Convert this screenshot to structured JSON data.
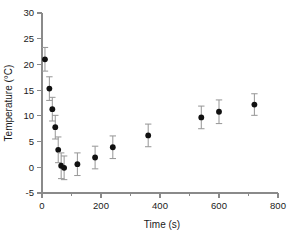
{
  "chart_data": {
    "type": "scatter",
    "title": "",
    "xlabel": "Time (s)",
    "ylabel": "Temperature (°C)",
    "xlim": [
      0,
      800
    ],
    "ylim": [
      -5,
      30
    ],
    "x_ticks": [
      0,
      200,
      400,
      600,
      800
    ],
    "x_tick_labels": [
      "0",
      "200",
      "400",
      "600",
      "800"
    ],
    "x_minor_ticks": [
      100,
      300,
      500,
      700
    ],
    "y_ticks": [
      -5,
      0,
      5,
      10,
      15,
      20,
      25,
      30
    ],
    "y_tick_labels": [
      "-5",
      "0",
      "5",
      "10",
      "15",
      "20",
      "25",
      "30"
    ],
    "grid": false,
    "legend": null,
    "marker_style": "filled-circle",
    "error_bars": "symmetric-vertical",
    "series": [
      {
        "name": "Temperature",
        "x": [
          10,
          25,
          35,
          45,
          55,
          65,
          75,
          120,
          180,
          240,
          360,
          540,
          600,
          720
        ],
        "y": [
          21.0,
          15.3,
          11.3,
          7.8,
          3.4,
          0.3,
          -0.1,
          0.6,
          1.9,
          3.9,
          6.2,
          9.7,
          10.8,
          12.2
        ],
        "yerr": [
          2.3,
          2.3,
          2.3,
          2.3,
          2.5,
          2.5,
          2.3,
          2.2,
          2.2,
          2.2,
          2.2,
          2.2,
          2.3,
          2.1
        ]
      }
    ]
  },
  "axes": {
    "x_axis_name": "time-axis",
    "y_axis_name": "temperature-axis"
  },
  "colors": {
    "marker": "#111111",
    "error_bar": "#9a9a9a",
    "axis": "#8a8a8a",
    "text": "#1a1a1a",
    "background": "#ffffff"
  }
}
